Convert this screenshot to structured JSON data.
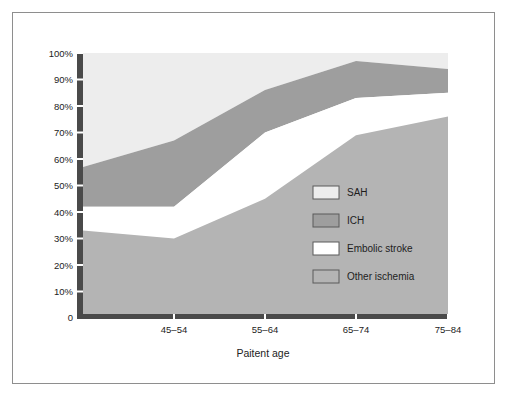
{
  "chart_data": {
    "type": "area",
    "title": "",
    "subtitle": "",
    "xlabel": "Paitent age",
    "ylabel": "",
    "stacked": true,
    "normalized": true,
    "grid": false,
    "legend_position": "inside-right",
    "xlim": [
      0,
      4
    ],
    "ylim": [
      0,
      100
    ],
    "x": [
      0,
      1,
      2,
      3,
      4
    ],
    "categories": [
      "",
      "45–54",
      "55–64",
      "65–74",
      "75–84"
    ],
    "xtick_labels": [
      "",
      "45–54",
      "55–64",
      "65–74",
      "75–84"
    ],
    "ytick_labels": [
      "0",
      "10%",
      "20%",
      "30%",
      "40%",
      "50%",
      "60%",
      "70%",
      "80%",
      "90%",
      "100%"
    ],
    "ytick_values": [
      0,
      10,
      20,
      30,
      40,
      50,
      60,
      70,
      80,
      90,
      100
    ],
    "series": [
      {
        "name": "Other ischemia",
        "color": "#b4b4b4",
        "values": [
          33,
          30,
          45,
          69,
          76
        ],
        "cumulative_top": [
          33,
          30,
          45,
          69,
          76
        ]
      },
      {
        "name": "Embolic stroke",
        "color": "#ffffff",
        "values": [
          9,
          12,
          25,
          14,
          9
        ],
        "cumulative_top": [
          42,
          42,
          70,
          83,
          85
        ]
      },
      {
        "name": "ICH",
        "color": "#9e9e9e",
        "values": [
          15,
          25,
          16,
          14,
          9
        ],
        "cumulative_top": [
          57,
          67,
          86,
          97,
          94
        ]
      },
      {
        "name": "SAH",
        "color": "#ededed",
        "values": [
          43,
          33,
          14,
          3,
          6
        ],
        "cumulative_top": [
          100,
          100,
          100,
          100,
          100
        ]
      }
    ],
    "legend_entries": [
      {
        "label": "SAH",
        "color": "#ededed"
      },
      {
        "label": "ICH",
        "color": "#9e9e9e"
      },
      {
        "label": "Embolic stroke",
        "color": "#ffffff"
      },
      {
        "label": "Other ischemia",
        "color": "#b4b4b4"
      }
    ]
  },
  "colors": {
    "frame_border": "#8e8e8e",
    "axis": "#4a4a4a",
    "text": "#232323",
    "background": "#ffffff",
    "sah": "#ededed",
    "ich": "#9e9e9e",
    "embolic": "#ffffff",
    "other_ischemia": "#b4b4b4"
  }
}
